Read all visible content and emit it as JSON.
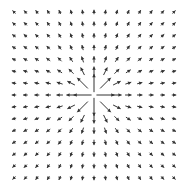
{
  "chart_data": {
    "type": "quiver",
    "title": "",
    "xlabel": "",
    "ylabel": "",
    "field": "radial source, magnitude ~ 1/r^2 (arrows point away from origin)",
    "grid": {
      "nx": 15,
      "ny": 15,
      "xlim": [
        -7,
        7
      ],
      "ylim": [
        -7,
        7
      ]
    },
    "center": [
      0,
      0
    ],
    "color": "#333333",
    "axes_visible": false
  }
}
